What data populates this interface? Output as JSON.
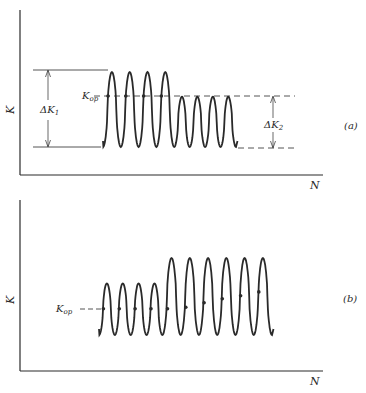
{
  "panel_a": {
    "tag": "(a)",
    "y_axis_label": "K",
    "x_axis_label": "N",
    "kop_label": "K",
    "kop_sub": "op",
    "delta_k1_label": "ΔK",
    "delta_k1_sub": "1",
    "delta_k2_label": "ΔK",
    "delta_k2_sub": "2",
    "blocks": [
      {
        "cycles": 4,
        "k_max": 1.0,
        "k_min": 0.0
      },
      {
        "cycles": 4,
        "k_max": 0.67,
        "k_min": 0.0
      }
    ],
    "kop_level": 0.67,
    "kop_markers": 4
  },
  "panel_b": {
    "tag": "(b)",
    "y_axis_label": "K",
    "x_axis_label": "N",
    "kop_label": "K",
    "kop_sub": "op",
    "blocks": [
      {
        "cycles": 4,
        "k_max": 0.67,
        "k_min": 0.0
      },
      {
        "cycles": 6,
        "k_max": 1.0,
        "k_min": 0.0
      }
    ],
    "kop_levels": [
      0.34,
      0.34,
      0.34,
      0.34,
      0.34,
      0.36,
      0.42,
      0.47,
      0.51,
      0.56
    ],
    "colors": {
      "ink": "#2a2a2a",
      "background": "#ffffff"
    }
  }
}
